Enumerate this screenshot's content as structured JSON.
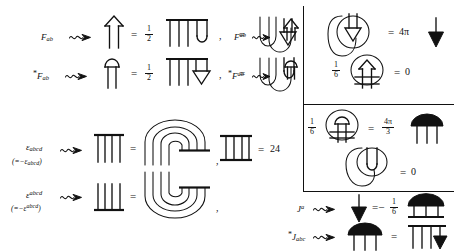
{
  "figure": {
    "kind": "penrose-diagrammatic-tensor-notation",
    "background": "#ffffff",
    "ink_color": "#111111"
  },
  "left_panel": {
    "rows": [
      {
        "id": "F-lower",
        "label": "F",
        "label_sub": "ab",
        "label_star": "",
        "squiggle": "squiggly-arrow",
        "equals": "=",
        "coefficient": {
          "numerator": "1",
          "denominator": "2"
        },
        "rhs_note": "three-legs-with-cup",
        "trailing": ","
      },
      {
        "id": "F-dual-lower",
        "label": "F",
        "label_sub": "ab",
        "label_star": "*",
        "squiggle": "squiggly-arrow",
        "equals": "=",
        "coefficient": {
          "numerator": "1",
          "denominator": "2"
        },
        "rhs_note": "three-legs-with-down-triangle",
        "trailing": ","
      }
    ],
    "rows_right": [
      {
        "id": "F-upper",
        "label": "F",
        "label_sup": "ab",
        "label_star": "",
        "squiggle": "squiggly-arrow",
        "equals": "=",
        "lhs_note": "down-double-triangle",
        "rhs_note": "u-bend-with-up-arrow"
      },
      {
        "id": "F-dual-upper",
        "label": "F",
        "label_sup": "ab",
        "label_star": "*",
        "squiggle": "squiggly-arrow",
        "equals": "=",
        "lhs_note": "down-cup",
        "rhs_note": "u-bend-with-cup"
      }
    ],
    "epsilon_rows": [
      {
        "id": "eps-lower",
        "label": "ε",
        "label_sub": "abcd",
        "antisym": "(=−ε",
        "antisym_sub": "abcd",
        "antisym_close": ")",
        "squiggle": "squiggly-arrow",
        "equals": "=",
        "rhs_note": "four-leg-nested-hook",
        "trailing": ","
      },
      {
        "id": "eps-upper",
        "label": "ε",
        "label_sup": "abcd",
        "antisym": "(=−ε",
        "antisym_sup": "abcd",
        "antisym_close": ")",
        "squiggle": "squiggly-arrow",
        "equals": "=",
        "rhs_note": "four-leg-nested-hook-mirrored",
        "trailing": ","
      }
    ],
    "eps_contraction": {
      "id": "eps-contraction",
      "diagram": "four-rungs-double-bar",
      "equals": "=",
      "value": "24"
    }
  },
  "right_panel": {
    "divider": "vertical-rule",
    "rows": [
      {
        "id": "loop-down-triangle",
        "coefficient": "",
        "diagram": "loop-around-down-triangle",
        "equals": "=",
        "value": "4π",
        "result_glyph": "down-solid-arrow"
      },
      {
        "id": "sixth-loop-up-hook",
        "coefficient": {
          "numerator": "1",
          "denominator": "6"
        },
        "diagram": "loop-around-up-hook-with-bars",
        "equals": "=",
        "value": "0",
        "result_glyph": ""
      },
      {
        "id": "sixth-loop-cap",
        "coefficient": {
          "numerator": "1",
          "denominator": "6"
        },
        "diagram": "loop-around-cap-with-bars",
        "equals": "=",
        "value": {
          "numerator": "4π",
          "denominator": "3"
        },
        "result_glyph": "solid-cap-three-legs"
      },
      {
        "id": "loop-cup-zero",
        "coefficient": "",
        "diagram": "loop-around-cup",
        "equals": "=",
        "value": "0",
        "result_glyph": ""
      }
    ],
    "current_rows": [
      {
        "id": "J-upper",
        "label": "J",
        "label_sup": "a",
        "label_star": "",
        "squiggle": "squiggly-arrow",
        "lhs_glyph": "down-solid-arrow",
        "equals": "=−",
        "coefficient": {
          "numerator": "1",
          "denominator": "6"
        },
        "rhs_note": "solid-cap-box-legs"
      },
      {
        "id": "J-dual-lower",
        "label": "J",
        "label_sub": "abc",
        "label_star": "*",
        "squiggle": "squiggly-arrow",
        "lhs_glyph": "solid-cap-three-legs",
        "equals": "=",
        "rhs_note": "three-legs-bar-down-arrow"
      }
    ],
    "horizontal_dividers": 2
  }
}
